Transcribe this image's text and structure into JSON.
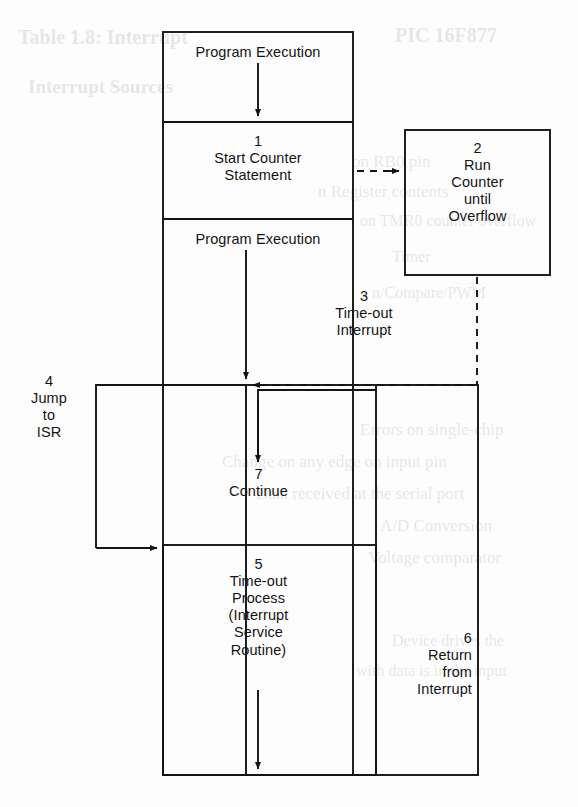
{
  "page": {
    "width": 578,
    "height": 807,
    "background_color": "#fdfdfd",
    "line_color": "#141414"
  },
  "diagram": {
    "type": "flowchart",
    "main_column": {
      "label": "Main Program Column",
      "x": 163,
      "y": 32,
      "width": 190,
      "height": 743
    },
    "blocks": [
      {
        "id": "program-execution-top",
        "number": "",
        "text": "Program Execution",
        "box": {
          "x": 163,
          "y": 32,
          "width": 190,
          "height": 90
        }
      },
      {
        "id": "start-counter-statement",
        "number": "1",
        "text": "Start Counter\nStatement",
        "full": "1\nStart Counter\nStatement",
        "box": {
          "x": 163,
          "y": 122,
          "width": 190,
          "height": 97
        }
      },
      {
        "id": "program-execution-middle",
        "number": "",
        "text": "Program Execution",
        "box": {
          "x": 163,
          "y": 219,
          "width": 190,
          "height": 166
        }
      },
      {
        "id": "run-counter-until-overflow",
        "number": "2",
        "text": "Run\nCounter\nuntil\nOverflow",
        "full": "2\nRun\nCounter\nuntil\nOverflow",
        "box": {
          "x": 405,
          "y": 130,
          "width": 145,
          "height": 145
        }
      },
      {
        "id": "continue",
        "number": "7",
        "text": "Continue",
        "full": "7\nContinue",
        "box": {
          "x": 246,
          "y": 385,
          "width": 130,
          "height": 160
        }
      },
      {
        "id": "time-out-process-isr",
        "number": "5",
        "text": "Time-out\nProcess\n(Interrupt\nService\nRoutine)",
        "full": "5\nTime-out\nProcess\n(Interrupt\nService\nRoutine)",
        "box": {
          "x": 163,
          "y": 545,
          "width": 213,
          "height": 230
        }
      },
      {
        "id": "return-from-interrupt",
        "number": "6",
        "text": "Return\nfrom\nInterrupt",
        "full": "6\nReturn\nfrom\nInterrupt",
        "box": {
          "x": 376,
          "y": 385,
          "width": 102,
          "height": 390
        }
      }
    ],
    "connector_labels": [
      {
        "id": "time-out-interrupt",
        "number": "3",
        "text": "Time-out\nInterrupt",
        "full": "3\nTime-out\nInterrupt",
        "style": "dashed",
        "position": {
          "x": 360,
          "y": 292
        }
      },
      {
        "id": "jump-to-isr",
        "number": "4",
        "text": "Jump\nto\nISR",
        "full": "4\nJump\nto\nISR",
        "style": "solid",
        "position": {
          "x": 40,
          "y": 378
        }
      }
    ],
    "arrows": [
      {
        "id": "arrow-program-to-start-counter",
        "style": "solid",
        "from": "program-execution-top",
        "to": "start-counter-statement"
      },
      {
        "id": "arrow-start-counter-to-run-counter",
        "style": "dashed",
        "from": "start-counter-statement",
        "to": "run-counter-until-overflow"
      },
      {
        "id": "arrow-program-middle-down",
        "style": "solid",
        "from": "program-execution-middle",
        "to": "interrupt-point"
      },
      {
        "id": "arrow-overflow-to-interrupt-point",
        "style": "dashed",
        "from": "run-counter-until-overflow",
        "to": "interrupt-point"
      },
      {
        "id": "arrow-jump-to-isr",
        "style": "solid",
        "from": "interrupt-point",
        "to": "time-out-process-isr"
      },
      {
        "id": "arrow-into-continue",
        "style": "solid",
        "from": "return-from-interrupt",
        "to": "continue"
      },
      {
        "id": "arrow-isr-exit-down",
        "style": "solid",
        "from": "time-out-process-isr",
        "to": "bottom"
      }
    ]
  },
  "ghost_text": {
    "lines": [
      {
        "text": "Table 1.8: Interrupt",
        "x": 18,
        "y": 26,
        "size": 20,
        "bold": true
      },
      {
        "text": "PIC 16F877",
        "x": 395,
        "y": 24,
        "size": 20,
        "bold": true
      },
      {
        "text": "Interrupt Sources",
        "x": 28,
        "y": 76,
        "size": 19,
        "bold": true
      },
      {
        "text": "on RB0 pin",
        "x": 352,
        "y": 152,
        "size": 17,
        "bold": false
      },
      {
        "text": "n Register contents",
        "x": 318,
        "y": 182,
        "size": 17,
        "bold": false
      },
      {
        "text": "on TMR0 counter overflow",
        "x": 360,
        "y": 212,
        "size": 16,
        "bold": false
      },
      {
        "text": "Timer",
        "x": 392,
        "y": 248,
        "size": 16,
        "bold": false
      },
      {
        "text": "n/Compare/PWM",
        "x": 372,
        "y": 284,
        "size": 16,
        "bold": false
      },
      {
        "text": "Errors on single-chip",
        "x": 360,
        "y": 420,
        "size": 17,
        "bold": false
      },
      {
        "text": "Change on any edge on  input pin",
        "x": 222,
        "y": 452,
        "size": 17,
        "bold": false
      },
      {
        "text": "Data received at the serial port",
        "x": 256,
        "y": 484,
        "size": 17,
        "bold": false
      },
      {
        "text": "A/D Conversion",
        "x": 380,
        "y": 516,
        "size": 17,
        "bold": false
      },
      {
        "text": "Voltage comparator",
        "x": 368,
        "y": 548,
        "size": 17,
        "bold": false
      },
      {
        "text": "Device drives the",
        "x": 392,
        "y": 632,
        "size": 16,
        "bold": false
      },
      {
        "text": "with data is in the input",
        "x": 356,
        "y": 662,
        "size": 16,
        "bold": false
      }
    ]
  }
}
